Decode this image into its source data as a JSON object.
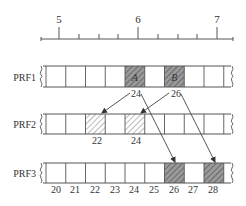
{
  "scale": {
    "major_ticks": [
      {
        "label": "5",
        "x": 59
      },
      {
        "label": "6",
        "x": 138
      },
      {
        "label": "7",
        "x": 217
      }
    ],
    "minor_tick_xs": [
      79,
      99,
      118,
      158,
      178,
      197
    ],
    "line": {
      "x1": 41,
      "x2": 233,
      "y": 39
    }
  },
  "colors": {
    "line": "#555555",
    "hatch_dark": "#8a8a8a",
    "hatch_light": "#b0b0b0",
    "hatch_fill_plain": "#ffffff",
    "text": "#333333"
  },
  "grid": {
    "x_start": 46,
    "cell_width": 19.75,
    "cell_count": 9,
    "x_end": 231
  },
  "rows": [
    {
      "label": "PRF1",
      "y": 66,
      "h": 21,
      "hatched": [
        {
          "index": 4,
          "style": "gray",
          "letter": "A"
        },
        {
          "index": 6,
          "style": "gray",
          "letter": "B"
        }
      ],
      "below_labels": [
        {
          "text": "24",
          "x": 136,
          "y": 97
        },
        {
          "text": "26",
          "x": 176,
          "y": 97
        }
      ]
    },
    {
      "label": "PRF2",
      "y": 114,
      "h": 20,
      "hatched": [
        {
          "index": 2,
          "style": "white",
          "letter": ""
        },
        {
          "index": 4,
          "style": "white",
          "letter": ""
        }
      ],
      "below_labels": [
        {
          "text": "22",
          "x": 97,
          "y": 144
        },
        {
          "text": "24",
          "x": 136,
          "y": 144
        }
      ]
    },
    {
      "label": "PRF3",
      "y": 163,
      "h": 20,
      "hatched": [
        {
          "index": 6,
          "style": "gray",
          "letter": ""
        },
        {
          "index": 8,
          "style": "gray",
          "letter": ""
        }
      ],
      "below_labels": [
        {
          "text": "20",
          "x": 56,
          "y": 193
        },
        {
          "text": "21",
          "x": 75,
          "y": 193
        },
        {
          "text": "22",
          "x": 95,
          "y": 193
        },
        {
          "text": "23",
          "x": 115,
          "y": 193
        },
        {
          "text": "24",
          "x": 134,
          "y": 193
        },
        {
          "text": "25",
          "x": 154,
          "y": 193
        },
        {
          "text": "26",
          "x": 174,
          "y": 193
        },
        {
          "text": "27",
          "x": 193,
          "y": 193
        },
        {
          "text": "28",
          "x": 213,
          "y": 193
        }
      ]
    }
  ],
  "arrows": [
    {
      "from": [
        130,
        93
      ],
      "to": [
        102,
        113
      ],
      "note": "24 to PRF2 cell 22"
    },
    {
      "from": [
        169,
        93
      ],
      "to": [
        141,
        113
      ],
      "note": "26 to PRF2 cell 24"
    },
    {
      "from": [
        141,
        94
      ],
      "to": [
        175,
        162
      ],
      "note": "24 to PRF3 cell 26"
    },
    {
      "from": [
        181,
        94
      ],
      "to": [
        215,
        162
      ],
      "note": "26 to PRF3 cell 28"
    }
  ]
}
